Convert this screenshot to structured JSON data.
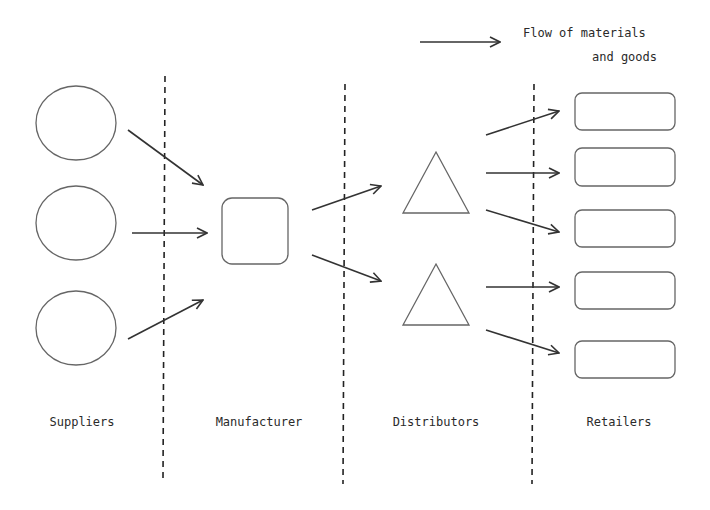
{
  "legend": {
    "line1": "Flow of materials",
    "line2": "and goods",
    "arrow_icon": "right-arrow-icon"
  },
  "stages": [
    {
      "label": "Suppliers",
      "shape": "circle",
      "count": 3
    },
    {
      "label": "Manufacturer",
      "shape": "rounded-square",
      "count": 1
    },
    {
      "label": "Distributors",
      "shape": "triangle",
      "count": 2
    },
    {
      "label": "Retailers",
      "shape": "rounded-rectangle",
      "count": 5
    }
  ],
  "colors": {
    "stroke": "#555555",
    "arrow": "#333333",
    "background": "#ffffff"
  }
}
